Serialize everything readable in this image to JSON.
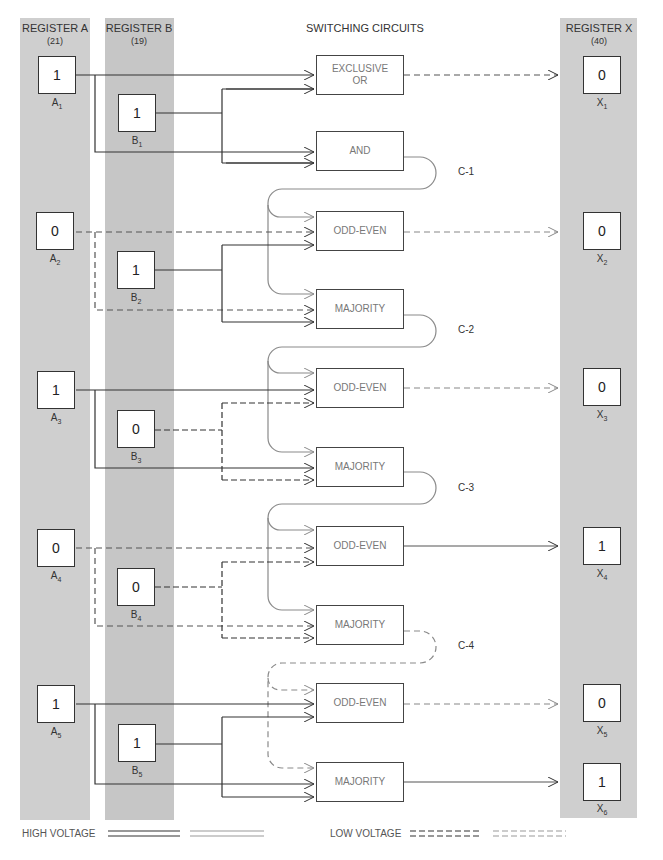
{
  "headers": {
    "register_a": {
      "title": "REGISTER A",
      "value": "(21)"
    },
    "register_b": {
      "title": "REGISTER B",
      "value": "(19)"
    },
    "switching": {
      "title": "SWITCHING CIRCUITS"
    },
    "register_x": {
      "title": "REGISTER X",
      "value": "(40)"
    }
  },
  "register_a": [
    {
      "label": "A",
      "index": "1",
      "bit": "1"
    },
    {
      "label": "A",
      "index": "2",
      "bit": "0"
    },
    {
      "label": "A",
      "index": "3",
      "bit": "1"
    },
    {
      "label": "A",
      "index": "4",
      "bit": "0"
    },
    {
      "label": "A",
      "index": "5",
      "bit": "1"
    }
  ],
  "register_b": [
    {
      "label": "B",
      "index": "1",
      "bit": "1"
    },
    {
      "label": "B",
      "index": "2",
      "bit": "1"
    },
    {
      "label": "B",
      "index": "3",
      "bit": "0"
    },
    {
      "label": "B",
      "index": "4",
      "bit": "0"
    },
    {
      "label": "B",
      "index": "5",
      "bit": "1"
    }
  ],
  "register_x": [
    {
      "label": "X",
      "index": "1",
      "bit": "0"
    },
    {
      "label": "X",
      "index": "2",
      "bit": "0"
    },
    {
      "label": "X",
      "index": "3",
      "bit": "0"
    },
    {
      "label": "X",
      "index": "4",
      "bit": "1"
    },
    {
      "label": "X",
      "index": "5",
      "bit": "0"
    },
    {
      "label": "X",
      "index": "6",
      "bit": "1"
    }
  ],
  "gates": [
    {
      "label": "EXCLUSIVE OR"
    },
    {
      "label": "AND"
    },
    {
      "label": "ODD-EVEN"
    },
    {
      "label": "MAJORITY"
    },
    {
      "label": "ODD-EVEN"
    },
    {
      "label": "MAJORITY"
    },
    {
      "label": "ODD-EVEN"
    },
    {
      "label": "MAJORITY"
    },
    {
      "label": "ODD-EVEN"
    },
    {
      "label": "MAJORITY"
    }
  ],
  "carries": [
    "C-1",
    "C-2",
    "C-3",
    "C-4"
  ],
  "legend": {
    "high": "HIGH VOLTAGE",
    "low": "LOW VOLTAGE"
  },
  "colors": {
    "register_fill": "#cfcfcf",
    "line_dark": "#333333",
    "line_gray": "#8a8a8a"
  }
}
